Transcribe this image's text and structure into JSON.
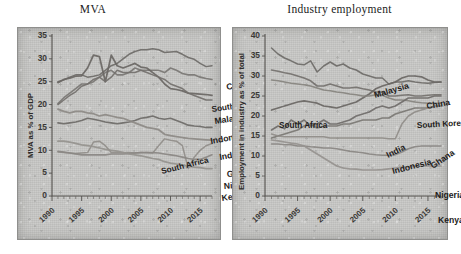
{
  "figure": {
    "panels": [
      {
        "id": "mva",
        "title": "MVA",
        "ylabel": "MVA as % of GDP"
      },
      {
        "id": "industry-employment",
        "title": "Industry employment",
        "ylabel": "Employment in industry as % of total"
      }
    ]
  },
  "chart_data": [
    {
      "type": "line",
      "title": "MVA",
      "xlabel": "",
      "ylabel": "MVA as % of GDP",
      "xlim": [
        1990,
        2017
      ],
      "ylim": [
        0,
        35
      ],
      "yticks": [
        0,
        5,
        10,
        15,
        20,
        25,
        30,
        35
      ],
      "xticks": [
        1990,
        1995,
        2000,
        2005,
        2010,
        2015
      ],
      "grid": false,
      "legend": "inline-right-labels",
      "x": [
        1991,
        1992,
        1993,
        1994,
        1995,
        1996,
        1997,
        1998,
        1999,
        2000,
        2001,
        2002,
        2003,
        2004,
        2005,
        2006,
        2007,
        2008,
        2009,
        2010,
        2011,
        2012,
        2013,
        2014,
        2015,
        2016,
        2017
      ],
      "series": [
        {
          "name": "China",
          "color": "#6e6b68",
          "values": [
            25.0,
            25.4,
            26.0,
            26.5,
            26.5,
            26.0,
            26.2,
            26.5,
            27.5,
            28.5,
            29.0,
            30.0,
            31.0,
            31.6,
            32.0,
            32.0,
            32.2,
            32.0,
            31.4,
            31.5,
            31.6,
            31.0,
            30.3,
            29.9,
            29.0,
            28.3,
            28.5
          ]
        },
        {
          "name": "South Korea",
          "color": "#7a7774",
          "values": [
            20.2,
            21.5,
            22.5,
            23.5,
            24.5,
            24.5,
            25.0,
            26.0,
            27.0,
            27.5,
            26.5,
            26.5,
            27.0,
            28.0,
            27.5,
            27.5,
            27.5,
            27.5,
            27.0,
            28.0,
            27.5,
            26.8,
            26.5,
            26.5,
            26.0,
            25.7,
            25.5
          ]
        },
        {
          "name": "Malaysia",
          "color": "#6a6764",
          "values": [
            24.8,
            25.5,
            25.8,
            26.2,
            26.3,
            28.0,
            30.8,
            30.5,
            25.0,
            30.8,
            28.5,
            28.0,
            28.5,
            29.0,
            28.2,
            28.0,
            27.0,
            26.0,
            24.5,
            23.5,
            23.3,
            23.0,
            22.5,
            22.4,
            22.3,
            22.2,
            22.0
          ]
        },
        {
          "name": "Indonesia",
          "color": "#73706d",
          "values": [
            20.0,
            21.0,
            22.0,
            22.8,
            24.0,
            24.5,
            25.5,
            26.0,
            25.0,
            26.0,
            27.5,
            27.0,
            27.0,
            27.0,
            27.5,
            27.0,
            26.5,
            26.0,
            25.5,
            24.5,
            24.0,
            23.5,
            22.5,
            22.0,
            21.5,
            21.0,
            21.0
          ]
        },
        {
          "name": "India",
          "color": "#6e6b68",
          "values": [
            16.0,
            15.8,
            16.0,
            16.2,
            16.5,
            17.0,
            16.8,
            16.5,
            16.2,
            16.0,
            15.8,
            16.0,
            16.2,
            16.5,
            17.0,
            17.2,
            17.5,
            17.0,
            16.8,
            17.0,
            16.5,
            16.0,
            15.5,
            15.3,
            15.2,
            15.0,
            15.0
          ]
        },
        {
          "name": "South Africa",
          "color": "#8d8a86",
          "values": [
            19.0,
            18.5,
            18.2,
            18.5,
            18.5,
            18.2,
            18.0,
            17.5,
            17.8,
            17.5,
            17.2,
            17.0,
            16.5,
            16.0,
            15.5,
            15.0,
            14.8,
            14.5,
            13.5,
            13.2,
            13.0,
            12.8,
            12.6,
            12.5,
            12.4,
            12.3,
            12.2
          ]
        },
        {
          "name": "Ghana",
          "color": "#918e8a",
          "values": [
            9.6,
            9.5,
            9.4,
            9.3,
            9.4,
            9.5,
            11.8,
            12.0,
            11.0,
            9.5,
            9.5,
            9.5,
            9.5,
            9.4,
            9.5,
            9.5,
            9.4,
            11.0,
            12.5,
            12.2,
            12.0,
            11.0,
            6.0,
            8.5,
            10.0,
            11.0,
            11.5
          ]
        },
        {
          "name": "Nigeria",
          "color": "#8a8783",
          "values": [
            9.8,
            9.6,
            9.4,
            9.2,
            9.0,
            9.0,
            9.0,
            9.0,
            9.0,
            9.2,
            9.2,
            9.2,
            9.3,
            9.4,
            9.5,
            9.5,
            9.5,
            9.4,
            9.2,
            9.0,
            8.8,
            8.5,
            8.2,
            8.0,
            8.0,
            8.5,
            9.0
          ]
        },
        {
          "name": "Kenya",
          "color": "#95928e",
          "values": [
            12.0,
            12.0,
            11.8,
            11.5,
            11.2,
            11.0,
            10.8,
            10.5,
            10.2,
            10.0,
            9.8,
            9.5,
            9.2,
            9.0,
            8.8,
            8.5,
            8.2,
            8.0,
            7.5,
            7.2,
            7.0,
            6.8,
            6.5,
            6.3,
            6.2,
            6.0,
            6.0
          ]
        }
      ]
    },
    {
      "type": "line",
      "title": "Industry employment",
      "xlabel": "",
      "ylabel": "Employment in industry as % of total",
      "xlim": [
        1990,
        2017
      ],
      "ylim": [
        0,
        40
      ],
      "yticks": [
        0,
        5,
        10,
        15,
        20,
        25,
        30,
        35,
        40
      ],
      "xticks": [
        1990,
        1995,
        2000,
        2005,
        2010,
        2015
      ],
      "grid": false,
      "legend": "inline-right-labels",
      "x": [
        1991,
        1992,
        1993,
        1994,
        1995,
        1996,
        1997,
        1998,
        1999,
        2000,
        2001,
        2002,
        2003,
        2004,
        2005,
        2006,
        2007,
        2008,
        2009,
        2010,
        2011,
        2012,
        2013,
        2014,
        2015,
        2016,
        2017
      ],
      "series": [
        {
          "name": "Malaysia",
          "color": "#6e6b68",
          "values": [
            37.0,
            35.5,
            34.5,
            33.8,
            33.0,
            32.8,
            33.8,
            31.0,
            32.5,
            33.5,
            32.5,
            33.0,
            32.0,
            31.5,
            30.5,
            30.0,
            29.5,
            29.5,
            28.0,
            28.5,
            28.5,
            28.8,
            28.5,
            28.3,
            28.2,
            28.4,
            28.5
          ]
        },
        {
          "name": "South Korea",
          "color": "#74716e",
          "values": [
            31.5,
            31.2,
            30.8,
            30.5,
            30.0,
            29.5,
            28.8,
            27.5,
            27.5,
            28.0,
            27.5,
            27.0,
            27.0,
            27.2,
            26.8,
            26.5,
            26.0,
            26.0,
            25.0,
            25.0,
            25.2,
            25.3,
            25.0,
            25.0,
            25.2,
            25.3,
            25.3
          ]
        },
        {
          "name": "China",
          "color": "#6a6764",
          "values": [
            21.5,
            22.0,
            22.5,
            23.0,
            23.5,
            23.8,
            23.5,
            23.2,
            22.5,
            22.3,
            22.0,
            22.5,
            23.0,
            23.5,
            24.5,
            25.5,
            26.8,
            27.5,
            28.0,
            28.5,
            29.5,
            30.0,
            30.0,
            29.8,
            29.0,
            28.5,
            28.5
          ]
        },
        {
          "name": "South Africa",
          "color": "#87847f",
          "values": [
            29.0,
            28.8,
            28.5,
            28.2,
            28.0,
            27.8,
            27.5,
            27.0,
            26.5,
            26.3,
            26.0,
            25.8,
            25.5,
            25.3,
            25.0,
            25.0,
            25.3,
            25.2,
            24.5,
            24.0,
            24.0,
            23.8,
            23.5,
            23.3,
            23.2,
            23.2,
            23.2
          ]
        },
        {
          "name": "India",
          "color": "#706d6a",
          "values": [
            16.5,
            17.5,
            16.8,
            19.0,
            18.0,
            19.0,
            17.5,
            18.0,
            19.0,
            18.0,
            18.0,
            18.5,
            19.0,
            20.0,
            20.5,
            21.0,
            22.0,
            22.5,
            22.0,
            22.5,
            23.5,
            24.5,
            24.5,
            24.5,
            24.5,
            25.0,
            25.0
          ]
        },
        {
          "name": "Indonesia",
          "color": "#7b7874",
          "values": [
            14.5,
            15.0,
            15.5,
            16.0,
            16.5,
            17.5,
            18.0,
            17.0,
            17.5,
            17.5,
            17.5,
            18.0,
            18.0,
            18.5,
            19.0,
            19.0,
            19.0,
            19.5,
            19.5,
            20.5,
            21.0,
            21.5,
            22.0,
            22.0,
            22.0,
            22.5,
            22.5
          ]
        },
        {
          "name": "Ghana",
          "color": "#908d89",
          "values": [
            15.5,
            15.0,
            14.8,
            14.8,
            14.8,
            14.8,
            14.8,
            14.8,
            14.8,
            14.5,
            14.5,
            14.5,
            14.5,
            14.5,
            14.5,
            14.5,
            14.5,
            14.5,
            14.3,
            14.3,
            18.0,
            20.0,
            21.0,
            21.5,
            22.0,
            22.3,
            22.5
          ]
        },
        {
          "name": "Nigeria",
          "color": "#8a8783",
          "values": [
            13.0,
            13.0,
            12.8,
            12.8,
            12.5,
            12.5,
            12.3,
            12.2,
            12.0,
            12.0,
            11.8,
            11.5,
            11.2,
            11.0,
            10.8,
            10.5,
            10.3,
            10.2,
            10.2,
            10.3,
            11.0,
            11.8,
            12.3,
            12.5,
            12.5,
            12.5,
            12.5
          ]
        },
        {
          "name": "Kenya",
          "color": "#96938f",
          "values": [
            14.0,
            13.8,
            13.5,
            13.2,
            13.0,
            12.5,
            11.5,
            10.5,
            9.5,
            8.5,
            7.5,
            7.0,
            6.8,
            6.7,
            6.5,
            6.5,
            6.5,
            6.6,
            6.8,
            7.0,
            7.2,
            7.3,
            7.4,
            7.5,
            7.5,
            7.5,
            7.5
          ]
        }
      ]
    }
  ],
  "labels": {
    "left": [
      {
        "text": "China",
        "x": 175,
        "y": 54,
        "rot": -12
      },
      {
        "text": "South Korea",
        "x": 160,
        "y": 76,
        "rot": -8
      },
      {
        "text": "Malaysia",
        "x": 163,
        "y": 88,
        "rot": -8
      },
      {
        "text": "Indonesia",
        "x": 159,
        "y": 108,
        "rot": -10
      },
      {
        "text": "India",
        "x": 168,
        "y": 124,
        "rot": -10
      },
      {
        "text": "South Africa",
        "x": 110,
        "y": 138,
        "rot": -14
      },
      {
        "text": "Ghana",
        "x": 175,
        "y": 141,
        "rot": -4
      },
      {
        "text": "Nigeria",
        "x": 172,
        "y": 153,
        "rot": -4
      },
      {
        "text": "Kenya",
        "x": 170,
        "y": 165,
        "rot": -8
      }
    ],
    "right": [
      {
        "text": "Malaysia",
        "x": 110,
        "y": 62,
        "rot": -16
      },
      {
        "text": "China",
        "x": 162,
        "y": 73,
        "rot": -10
      },
      {
        "text": "South Africa",
        "x": 14,
        "y": 92,
        "rot": 0
      },
      {
        "text": "South Korea",
        "x": 152,
        "y": 92,
        "rot": -3
      },
      {
        "text": "India",
        "x": 123,
        "y": 122,
        "rot": -26
      },
      {
        "text": "Indonesia",
        "x": 128,
        "y": 138,
        "rot": -14
      },
      {
        "text": "Ghana",
        "x": 168,
        "y": 133,
        "rot": -34
      },
      {
        "text": "Nigeria",
        "x": 170,
        "y": 162,
        "rot": 0
      },
      {
        "text": "Kenya",
        "x": 173,
        "y": 187,
        "rot": 0
      }
    ]
  }
}
